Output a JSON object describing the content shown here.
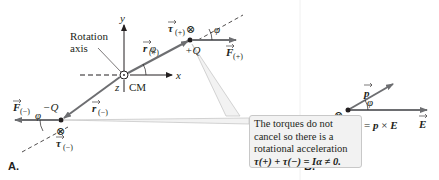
{
  "panel_a": {
    "label": "A.",
    "axes": {
      "x": "x",
      "y": "y",
      "z": "z"
    },
    "rotation_axis_label_line1": "Rotation",
    "rotation_axis_label_line2": "axis",
    "cm_label": "CM",
    "positive_charge": "+Q",
    "negative_charge": "−Q",
    "r_plus": "r",
    "r_plus_sub": "(+)",
    "r_minus": "r",
    "r_minus_sub": "(−)",
    "tau_plus": "τ",
    "tau_plus_sub": "(+)",
    "tau_minus": "τ",
    "tau_minus_sub": "(−)",
    "F_plus": "F",
    "F_plus_sub": "(+)",
    "F_minus": "F",
    "F_minus_sub": "(−)",
    "angle": "φ",
    "into_page_symbol": "⊗",
    "callout": {
      "line1": "The torques do not",
      "line2": "cancel so there is a",
      "line3": "rotational acceleration",
      "equation": "τ(+) + τ(−) = Iα ≠ 0."
    }
  },
  "panel_b": {
    "label": "B.",
    "p_label": "p",
    "E_label": "E",
    "angle": "φ",
    "into_page_symbol": "⊗",
    "equation": "τ(+) + τ(−) = τ = p × E"
  },
  "colors": {
    "arrow": "#6d6e71",
    "text": "#231f20",
    "callout_bg": "#f2f2f2",
    "callout_border": "#c8c8c8",
    "dashed": "#231f20"
  }
}
